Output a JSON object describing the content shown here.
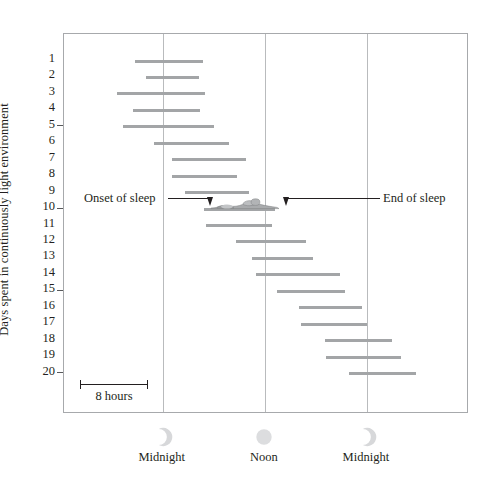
{
  "chart_data": {
    "type": "bar",
    "title": "",
    "subtitle": "",
    "ylabel": "Days spent in continuously light environment",
    "xlabel": "",
    "grid": true,
    "legend_position": "none",
    "x_axis": {
      "unit": "time of day",
      "ticks": [
        {
          "label": "Midnight",
          "icon": "crescent-moon-icon",
          "hour": 0
        },
        {
          "label": "Noon",
          "icon": "sun-icon",
          "hour": 12
        },
        {
          "label": "Midnight",
          "icon": "crescent-moon-icon",
          "hour": 24
        }
      ],
      "range_hours": [
        -11.6,
        36.0
      ]
    },
    "y_axis": {
      "tick_labels": [
        1,
        2,
        3,
        4,
        5,
        6,
        7,
        8,
        9,
        10,
        11,
        12,
        13,
        14,
        15,
        16,
        17,
        18,
        19,
        20
      ],
      "major_ticks": [
        5,
        10,
        15,
        20
      ],
      "range": [
        0.5,
        20.5
      ]
    },
    "scale_bar": {
      "label": "8 hours",
      "hours": 8
    },
    "annotations": [
      {
        "name": "onset-of-sleep",
        "label": "Onset of sleep",
        "day": 10
      },
      {
        "name": "end-of-sleep",
        "label": "End of sleep",
        "day": 10
      },
      {
        "name": "sleeping-person",
        "label": "sleeping-person-icon",
        "day": 10
      }
    ],
    "series_name": "Sleep episode",
    "bar_color": "#a3a5a7",
    "categories": [
      1,
      2,
      3,
      4,
      5,
      6,
      7,
      8,
      9,
      10,
      11,
      12,
      13,
      14,
      15,
      16,
      17,
      18,
      19,
      20
    ],
    "bars": [
      {
        "day": 1,
        "start_hour": -3.3,
        "end_hour": 4.7
      },
      {
        "day": 2,
        "start_hour": -2.0,
        "end_hour": 4.3
      },
      {
        "day": 3,
        "start_hour": -5.4,
        "end_hour": 5.0
      },
      {
        "day": 4,
        "start_hour": -3.5,
        "end_hour": 4.4
      },
      {
        "day": 5,
        "start_hour": -4.7,
        "end_hour": 6.0
      },
      {
        "day": 6,
        "start_hour": -1.0,
        "end_hour": 7.8
      },
      {
        "day": 7,
        "start_hour": 1.1,
        "end_hour": 9.8
      },
      {
        "day": 8,
        "start_hour": 1.1,
        "end_hour": 8.7
      },
      {
        "day": 9,
        "start_hour": 2.6,
        "end_hour": 10.2
      },
      {
        "day": 10,
        "start_hour": 4.8,
        "end_hour": 13.2
      },
      {
        "day": 11,
        "start_hour": 5.1,
        "end_hour": 12.9
      },
      {
        "day": 12,
        "start_hour": 8.6,
        "end_hour": 16.9
      },
      {
        "day": 13,
        "start_hour": 10.5,
        "end_hour": 17.7
      },
      {
        "day": 14,
        "start_hour": 11.0,
        "end_hour": 20.8
      },
      {
        "day": 15,
        "start_hour": 13.4,
        "end_hour": 21.4
      },
      {
        "day": 16,
        "start_hour": 16.0,
        "end_hour": 23.4
      },
      {
        "day": 17,
        "start_hour": 16.2,
        "end_hour": 24.0
      },
      {
        "day": 18,
        "start_hour": 19.1,
        "end_hour": 27.0
      },
      {
        "day": 19,
        "start_hour": 19.2,
        "end_hour": 28.0
      },
      {
        "day": 20,
        "start_hour": 21.9,
        "end_hour": 29.8
      }
    ]
  }
}
